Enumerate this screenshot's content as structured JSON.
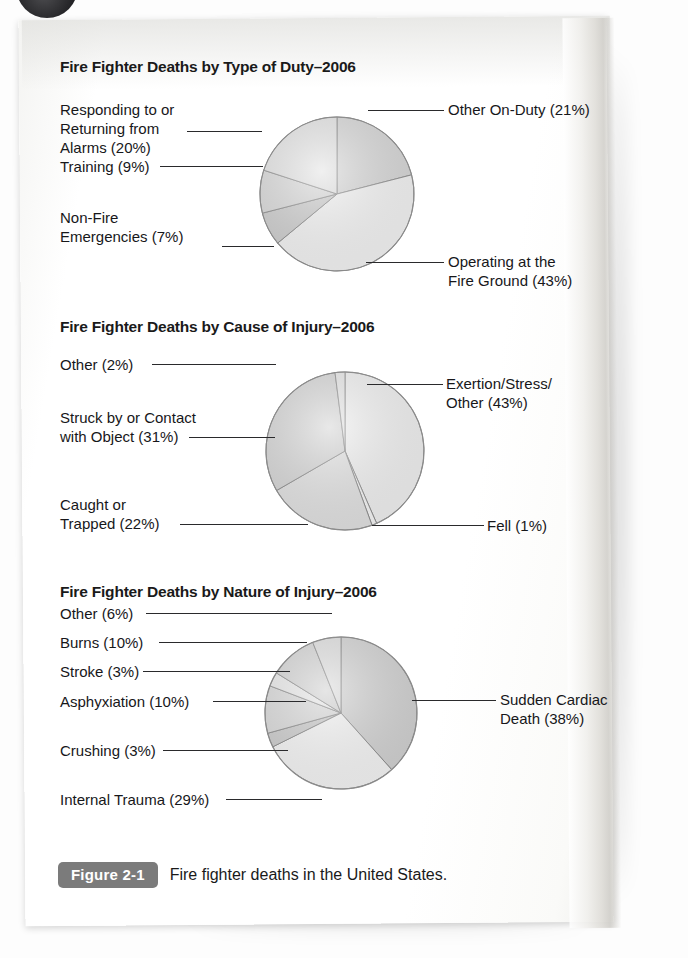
{
  "page": {
    "figure_badge": "Figure 2-1",
    "caption": "Fire fighter deaths in the United States."
  },
  "chart_data": [
    {
      "type": "pie",
      "id": "type-of-duty",
      "title": "Fire Fighter Deaths by Type of Duty–2006",
      "categories": [
        "Other On-Duty",
        "Operating at the Fire Ground",
        "Non-Fire Emergencies",
        "Training",
        "Responding to or Returning from Alarms"
      ],
      "values": [
        21,
        43,
        7,
        9,
        20
      ],
      "unit": "%",
      "labels": [
        "Other On-Duty (21%)",
        "Operating at the\nFire Ground (43%)",
        "Non-Fire\nEmergencies (7%)",
        "Training (9%)",
        "Responding to or\nReturning from\nAlarms (20%)"
      ],
      "slice_colors": [
        "#cfcfcf",
        "#f1f1f1",
        "#c4c4c4",
        "#d2d2d2",
        "#dedede"
      ],
      "start_angle": 0,
      "legend": "callout-labels"
    },
    {
      "type": "pie",
      "id": "cause-of-injury",
      "title": "Fire Fighter Deaths by Cause of Injury–2006",
      "categories": [
        "Exertion/Stress/Other",
        "Fell",
        "Caught or Trapped",
        "Struck by or Contact with Object",
        "Other"
      ],
      "values": [
        43,
        1,
        22,
        31,
        2
      ],
      "unit": "%",
      "labels": [
        "Exertion/Stress/\nOther (43%)",
        "Fell (1%)",
        "Caught or\nTrapped (22%)",
        "Struck by or Contact\nwith Object (31%)",
        "Other (2%)"
      ],
      "slice_colors": [
        "#ededed",
        "#f4f4f4",
        "#dcdcdc",
        "#cdcdcd",
        "#e2e2e2"
      ],
      "start_angle": 0,
      "legend": "callout-labels"
    },
    {
      "type": "pie",
      "id": "nature-of-injury",
      "title": "Fire Fighter Deaths by Nature of Injury–2006",
      "categories": [
        "Sudden Cardiac Death",
        "Internal Trauma",
        "Crushing",
        "Asphyxiation",
        "Stroke",
        "Burns",
        "Other"
      ],
      "values": [
        38,
        29,
        3,
        10,
        3,
        10,
        6
      ],
      "unit": "%",
      "labels": [
        "Sudden Cardiac\nDeath (38%)",
        "Internal Trauma (29%)",
        "Crushing (3%)",
        "Asphyxiation (10%)",
        "Stroke (3%)",
        "Burns (10%)",
        "Other (6%)"
      ],
      "slice_colors": [
        "#c9c9c9",
        "#f2f2f2",
        "#c2c2c2",
        "#d2d2d2",
        "#e4e4e4",
        "#cccccc",
        "#d8d8d8"
      ],
      "start_angle": 0,
      "legend": "callout-labels"
    }
  ]
}
